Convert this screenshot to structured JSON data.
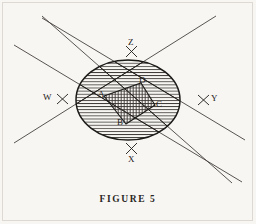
{
  "figure": {
    "caption": "FIGURE 5",
    "background_color": "#f7f6f3",
    "ink_color": "#2a2724",
    "border_color": "#ddd9d2"
  },
  "diagram": {
    "type": "geometric-line-diagram",
    "ellipse": {
      "center_x": 128,
      "center_y": 100,
      "radius_x": 52,
      "radius_y": 40,
      "fill_pattern": "horizontal-hatch",
      "stroke_color": "#2a2724"
    },
    "inner_polygon": {
      "name": "rhombus-ABCD",
      "fill_pattern": "vertical-hatch",
      "vertices": [
        {
          "label": "A",
          "x": 104,
          "y": 96
        },
        {
          "label": "B",
          "x": 126,
          "y": 124
        },
        {
          "label": "C",
          "x": 155,
          "y": 105
        },
        {
          "label": "D",
          "x": 141,
          "y": 83
        }
      ]
    },
    "lines": [
      {
        "name": "line-W",
        "direction": "down-right",
        "x1": 14,
        "y1": 45,
        "x2": 242,
        "y2": 182
      },
      {
        "name": "line-Y",
        "direction": "down-right",
        "x1": 42,
        "y1": 18,
        "x2": 240,
        "y2": 140
      },
      {
        "name": "line-Z",
        "direction": "down-left",
        "x1": 40,
        "y1": 16,
        "x2": 230,
        "y2": 182
      },
      {
        "name": "line-X",
        "direction": "down-left",
        "x1": 16,
        "y1": 140,
        "x2": 214,
        "y2": 18
      }
    ],
    "vertex_labels": [
      {
        "text": "A",
        "x": 99,
        "y": 92
      },
      {
        "text": "B",
        "x": 118,
        "y": 120
      },
      {
        "text": "C",
        "x": 156,
        "y": 101
      },
      {
        "text": "D",
        "x": 139,
        "y": 77
      }
    ],
    "axis_labels": [
      {
        "text": "W",
        "x": 44,
        "y": 94,
        "tick_x": 62,
        "tick_y": 99
      },
      {
        "text": "Y",
        "x": 211,
        "y": 96,
        "tick_x": 204,
        "tick_y": 100
      },
      {
        "text": "Z",
        "x": 130,
        "y": 40,
        "tick_x": 131,
        "tick_y": 52
      },
      {
        "text": "X",
        "x": 128,
        "y": 156,
        "tick_x": 130,
        "tick_y": 150
      }
    ]
  }
}
